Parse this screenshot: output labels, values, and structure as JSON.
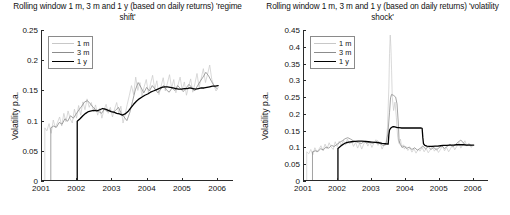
{
  "figure": {
    "width": 510,
    "height": 215,
    "background": "#ffffff"
  },
  "axis_label": "Volatility p.a.",
  "colors": {
    "series_1m": "#c8c8c8",
    "series_3m": "#8c8c8c",
    "series_1y": "#000000",
    "axis": "#2a2a2a",
    "text": "#111111"
  },
  "chart_data": [
    {
      "type": "line",
      "panel": "left",
      "title": "Rolling window 1 m, 3 m and 1 y (based on daily returns) 'regime shift'",
      "xlabel": "",
      "ylabel": "Volatility p.a.",
      "xlim": [
        2001.0,
        2006.45
      ],
      "ylim": [
        0,
        0.25
      ],
      "xticks": [
        2001,
        2002,
        2003,
        2004,
        2005,
        2006
      ],
      "xticklabels": [
        "2001",
        "2002",
        "2003",
        "2004",
        "2005",
        "2006"
      ],
      "yticks": [
        0,
        0.05,
        0.1,
        0.15,
        0.2,
        0.25
      ],
      "yticklabels": [
        "0",
        "0.05",
        "0.1",
        "0.15",
        "0.2",
        "0.25"
      ],
      "grid": false,
      "legend_position": "upper-left",
      "legend": [
        "1 m",
        "3 m",
        "1 y"
      ],
      "series": [
        {
          "name": "1 m",
          "color": "#c8c8c8",
          "width": 0.7,
          "x": [
            2001.08,
            2001.08,
            2001.14,
            2001.2,
            2001.26,
            2001.32,
            2001.38,
            2001.44,
            2001.5,
            2001.56,
            2001.62,
            2001.68,
            2001.74,
            2001.8,
            2001.86,
            2001.92,
            2001.98,
            2002.04,
            2002.1,
            2002.16,
            2002.22,
            2002.28,
            2002.34,
            2002.4,
            2002.46,
            2002.52,
            2002.58,
            2002.64,
            2002.7,
            2002.76,
            2002.82,
            2002.88,
            2002.94,
            2003.0,
            2003.06,
            2003.12,
            2003.18,
            2003.24,
            2003.3,
            2003.36,
            2003.42,
            2003.48,
            2003.54,
            2003.6,
            2003.66,
            2003.72,
            2003.78,
            2003.84,
            2003.9,
            2003.96,
            2004.02,
            2004.08,
            2004.14,
            2004.2,
            2004.26,
            2004.32,
            2004.38,
            2004.44,
            2004.5,
            2004.56,
            2004.62,
            2004.68,
            2004.74,
            2004.8,
            2004.86,
            2004.92,
            2004.98,
            2005.04,
            2005.1,
            2005.16,
            2005.22,
            2005.28,
            2005.34,
            2005.4,
            2005.46,
            2005.52,
            2005.58,
            2005.64,
            2005.7,
            2005.76,
            2005.82,
            2005.88,
            2005.94,
            2006.0
          ],
          "y": [
            0.0,
            0.088,
            0.083,
            0.095,
            0.079,
            0.101,
            0.088,
            0.097,
            0.106,
            0.091,
            0.112,
            0.098,
            0.116,
            0.103,
            0.096,
            0.119,
            0.104,
            0.125,
            0.109,
            0.131,
            0.118,
            0.136,
            0.122,
            0.13,
            0.115,
            0.126,
            0.109,
            0.121,
            0.104,
            0.118,
            0.127,
            0.112,
            0.122,
            0.106,
            0.119,
            0.13,
            0.112,
            0.124,
            0.096,
            0.11,
            0.127,
            0.142,
            0.158,
            0.143,
            0.172,
            0.15,
            0.163,
            0.141,
            0.156,
            0.168,
            0.146,
            0.161,
            0.175,
            0.152,
            0.166,
            0.143,
            0.157,
            0.171,
            0.149,
            0.162,
            0.176,
            0.154,
            0.168,
            0.146,
            0.159,
            0.172,
            0.151,
            0.164,
            0.142,
            0.156,
            0.169,
            0.147,
            0.161,
            0.178,
            0.155,
            0.17,
            0.186,
            0.163,
            0.177,
            0.192,
            0.168,
            0.158,
            0.149,
            0.155
          ]
        },
        {
          "name": "3 m",
          "color": "#8c8c8c",
          "width": 0.8,
          "x": [
            2001.25,
            2001.25,
            2001.33,
            2001.41,
            2001.49,
            2001.57,
            2001.65,
            2001.73,
            2001.81,
            2001.89,
            2001.97,
            2002.05,
            2002.13,
            2002.21,
            2002.29,
            2002.37,
            2002.45,
            2002.53,
            2002.61,
            2002.69,
            2002.77,
            2002.85,
            2002.93,
            2003.01,
            2003.09,
            2003.17,
            2003.25,
            2003.33,
            2003.41,
            2003.49,
            2003.57,
            2003.65,
            2003.73,
            2003.81,
            2003.89,
            2003.97,
            2004.05,
            2004.13,
            2004.21,
            2004.29,
            2004.37,
            2004.45,
            2004.53,
            2004.61,
            2004.69,
            2004.77,
            2004.85,
            2004.93,
            2005.01,
            2005.09,
            2005.17,
            2005.25,
            2005.33,
            2005.41,
            2005.49,
            2005.57,
            2005.65,
            2005.73,
            2005.81,
            2005.89,
            2005.97
          ],
          "y": [
            0.0,
            0.088,
            0.091,
            0.089,
            0.097,
            0.094,
            0.103,
            0.099,
            0.108,
            0.104,
            0.111,
            0.118,
            0.124,
            0.131,
            0.133,
            0.128,
            0.122,
            0.118,
            0.115,
            0.112,
            0.119,
            0.115,
            0.118,
            0.113,
            0.117,
            0.122,
            0.112,
            0.106,
            0.1,
            0.113,
            0.132,
            0.151,
            0.163,
            0.155,
            0.146,
            0.155,
            0.149,
            0.158,
            0.152,
            0.146,
            0.152,
            0.158,
            0.151,
            0.147,
            0.154,
            0.15,
            0.158,
            0.153,
            0.148,
            0.154,
            0.16,
            0.155,
            0.149,
            0.157,
            0.165,
            0.172,
            0.18,
            0.174,
            0.165,
            0.157,
            0.153
          ]
        },
        {
          "name": "1 y",
          "color": "#000000",
          "width": 1.3,
          "x": [
            2001.0,
            2002.0,
            2002.0,
            2002.08,
            2002.16,
            2002.24,
            2002.32,
            2002.4,
            2002.48,
            2002.56,
            2002.64,
            2002.72,
            2002.8,
            2002.88,
            2002.96,
            2003.04,
            2003.12,
            2003.2,
            2003.28,
            2003.36,
            2003.44,
            2003.52,
            2003.6,
            2003.68,
            2003.76,
            2003.84,
            2003.92,
            2004.0,
            2004.08,
            2004.16,
            2004.24,
            2004.32,
            2004.4,
            2004.48,
            2004.56,
            2004.64,
            2004.72,
            2004.8,
            2004.88,
            2004.96,
            2005.04,
            2005.12,
            2005.2,
            2005.28,
            2005.36,
            2005.44,
            2005.52,
            2005.6,
            2005.68,
            2005.76,
            2005.84,
            2005.92,
            2006.0
          ],
          "y": [
            0.0,
            0.0,
            0.099,
            0.103,
            0.108,
            0.112,
            0.115,
            0.116,
            0.117,
            0.116,
            0.118,
            0.12,
            0.119,
            0.117,
            0.115,
            0.114,
            0.112,
            0.111,
            0.109,
            0.111,
            0.115,
            0.121,
            0.127,
            0.132,
            0.136,
            0.139,
            0.142,
            0.144,
            0.147,
            0.149,
            0.151,
            0.153,
            0.155,
            0.156,
            0.156,
            0.155,
            0.154,
            0.153,
            0.152,
            0.152,
            0.153,
            0.153,
            0.154,
            0.153,
            0.152,
            0.153,
            0.154,
            0.154,
            0.155,
            0.156,
            0.157,
            0.157,
            0.158
          ]
        }
      ]
    },
    {
      "type": "line",
      "panel": "right",
      "title": "Rolling window 1 m, 3 m and 1 y (based on daily returns) 'volatility shock'",
      "xlabel": "",
      "ylabel": "Volatility p.a.",
      "xlim": [
        2001.0,
        2006.45
      ],
      "ylim": [
        0,
        0.45
      ],
      "xticks": [
        2001,
        2002,
        2003,
        2004,
        2005,
        2006
      ],
      "xticklabels": [
        "2001",
        "2002",
        "2003",
        "2004",
        "2005",
        "2006"
      ],
      "yticks": [
        0,
        0.05,
        0.1,
        0.15,
        0.2,
        0.25,
        0.3,
        0.35,
        0.4,
        0.45
      ],
      "yticklabels": [
        "0",
        "0.05",
        "0.1",
        "0.15",
        "0.2",
        "0.25",
        "0.3",
        "0.35",
        "0.4",
        "0.45"
      ],
      "grid": false,
      "legend_position": "upper-left",
      "legend": [
        "1 m",
        "3 m",
        "1 y"
      ],
      "series": [
        {
          "name": "1 m",
          "color": "#c8c8c8",
          "width": 0.7,
          "x": [
            2001.08,
            2001.08,
            2001.14,
            2001.2,
            2001.26,
            2001.32,
            2001.38,
            2001.44,
            2001.5,
            2001.56,
            2001.62,
            2001.68,
            2001.74,
            2001.8,
            2001.86,
            2001.92,
            2001.98,
            2002.04,
            2002.1,
            2002.16,
            2002.22,
            2002.28,
            2002.34,
            2002.4,
            2002.46,
            2002.52,
            2002.58,
            2002.64,
            2002.7,
            2002.76,
            2002.82,
            2002.88,
            2002.94,
            2003.0,
            2003.06,
            2003.12,
            2003.18,
            2003.24,
            2003.3,
            2003.36,
            2003.42,
            2003.46,
            2003.5,
            2003.52,
            2003.54,
            2003.56,
            2003.58,
            2003.6,
            2003.64,
            2003.68,
            2003.72,
            2003.76,
            2003.8,
            2003.84,
            2003.88,
            2003.92,
            2003.96,
            2004.0,
            2004.06,
            2004.12,
            2004.18,
            2004.24,
            2004.3,
            2004.36,
            2004.42,
            2004.48,
            2004.54,
            2004.6,
            2004.66,
            2004.72,
            2004.78,
            2004.84,
            2004.9,
            2004.96,
            2005.02,
            2005.08,
            2005.14,
            2005.2,
            2005.26,
            2005.32,
            2005.38,
            2005.44,
            2005.5,
            2005.56,
            2005.62,
            2005.68,
            2005.74,
            2005.8,
            2005.86,
            2005.92,
            2005.98
          ],
          "y": [
            0.0,
            0.087,
            0.081,
            0.094,
            0.078,
            0.099,
            0.086,
            0.095,
            0.105,
            0.09,
            0.11,
            0.096,
            0.114,
            0.101,
            0.094,
            0.117,
            0.102,
            0.119,
            0.104,
            0.122,
            0.107,
            0.125,
            0.11,
            0.118,
            0.103,
            0.115,
            0.098,
            0.112,
            0.095,
            0.11,
            0.12,
            0.104,
            0.116,
            0.1,
            0.113,
            0.123,
            0.106,
            0.117,
            0.095,
            0.108,
            0.113,
            0.16,
            0.28,
            0.38,
            0.435,
            0.4,
            0.33,
            0.25,
            0.21,
            0.235,
            0.19,
            0.13,
            0.112,
            0.125,
            0.1,
            0.108,
            0.095,
            0.103,
            0.091,
            0.099,
            0.086,
            0.096,
            0.083,
            0.094,
            0.089,
            0.1,
            0.087,
            0.097,
            0.084,
            0.093,
            0.105,
            0.089,
            0.098,
            0.085,
            0.094,
            0.104,
            0.09,
            0.1,
            0.087,
            0.097,
            0.108,
            0.093,
            0.103,
            0.115,
            0.098,
            0.109,
            0.12,
            0.104,
            0.112,
            0.1,
            0.106
          ]
        },
        {
          "name": "3 m",
          "color": "#8c8c8c",
          "width": 0.8,
          "x": [
            2001.25,
            2001.25,
            2001.33,
            2001.41,
            2001.49,
            2001.57,
            2001.65,
            2001.73,
            2001.81,
            2001.89,
            2001.97,
            2002.05,
            2002.13,
            2002.21,
            2002.29,
            2002.37,
            2002.45,
            2002.53,
            2002.61,
            2002.69,
            2002.77,
            2002.85,
            2002.93,
            2003.01,
            2003.09,
            2003.17,
            2003.25,
            2003.33,
            2003.41,
            2003.47,
            2003.52,
            2003.55,
            2003.58,
            2003.64,
            2003.7,
            2003.74,
            2003.78,
            2003.8,
            2003.84,
            2003.9,
            2003.96,
            2004.02,
            2004.1,
            2004.18,
            2004.26,
            2004.34,
            2004.42,
            2004.5,
            2004.58,
            2004.66,
            2004.74,
            2004.82,
            2004.9,
            2004.98,
            2005.06,
            2005.14,
            2005.22,
            2005.3,
            2005.38,
            2005.46,
            2005.54,
            2005.62,
            2005.7,
            2005.78,
            2005.86,
            2005.94
          ],
          "y": [
            0.0,
            0.087,
            0.09,
            0.088,
            0.096,
            0.093,
            0.101,
            0.098,
            0.106,
            0.103,
            0.109,
            0.115,
            0.12,
            0.126,
            0.129,
            0.125,
            0.12,
            0.117,
            0.114,
            0.112,
            0.117,
            0.113,
            0.116,
            0.112,
            0.115,
            0.119,
            0.111,
            0.106,
            0.108,
            0.14,
            0.205,
            0.248,
            0.258,
            0.255,
            0.25,
            0.23,
            0.17,
            0.12,
            0.108,
            0.1,
            0.104,
            0.097,
            0.101,
            0.094,
            0.099,
            0.092,
            0.097,
            0.104,
            0.096,
            0.102,
            0.094,
            0.1,
            0.093,
            0.099,
            0.105,
            0.097,
            0.103,
            0.11,
            0.102,
            0.108,
            0.116,
            0.122,
            0.113,
            0.106,
            0.11,
            0.105
          ]
        },
        {
          "name": "1 y",
          "color": "#000000",
          "width": 1.3,
          "x": [
            2001.0,
            2002.0,
            2002.0,
            2002.06,
            2002.12,
            2002.18,
            2002.24,
            2002.32,
            2002.4,
            2002.5,
            2002.6,
            2002.7,
            2002.8,
            2002.9,
            2003.0,
            2003.1,
            2003.2,
            2003.3,
            2003.4,
            2003.48,
            2003.5,
            2003.52,
            2003.56,
            2003.6,
            2003.64,
            2003.68,
            2003.72,
            2003.76,
            2003.8,
            2003.88,
            2003.96,
            2004.04,
            2004.12,
            2004.2,
            2004.28,
            2004.36,
            2004.44,
            2004.48,
            2004.5,
            2004.52,
            2004.56,
            2004.62,
            2004.7,
            2004.78,
            2004.86,
            2004.94,
            2005.02,
            2005.1,
            2005.2,
            2005.3,
            2005.4,
            2005.5,
            2005.6,
            2005.7,
            2005.8,
            2005.9,
            2006.0
          ],
          "y": [
            0.0,
            0.0,
            0.097,
            0.102,
            0.107,
            0.111,
            0.114,
            0.116,
            0.117,
            0.118,
            0.119,
            0.119,
            0.118,
            0.117,
            0.116,
            0.115,
            0.114,
            0.112,
            0.111,
            0.11,
            0.138,
            0.152,
            0.158,
            0.161,
            0.162,
            0.161,
            0.16,
            0.159,
            0.159,
            0.158,
            0.158,
            0.158,
            0.158,
            0.158,
            0.158,
            0.158,
            0.158,
            0.157,
            0.13,
            0.111,
            0.106,
            0.104,
            0.103,
            0.103,
            0.104,
            0.104,
            0.105,
            0.106,
            0.106,
            0.107,
            0.107,
            0.108,
            0.108,
            0.108,
            0.107,
            0.107,
            0.107
          ]
        }
      ]
    }
  ]
}
